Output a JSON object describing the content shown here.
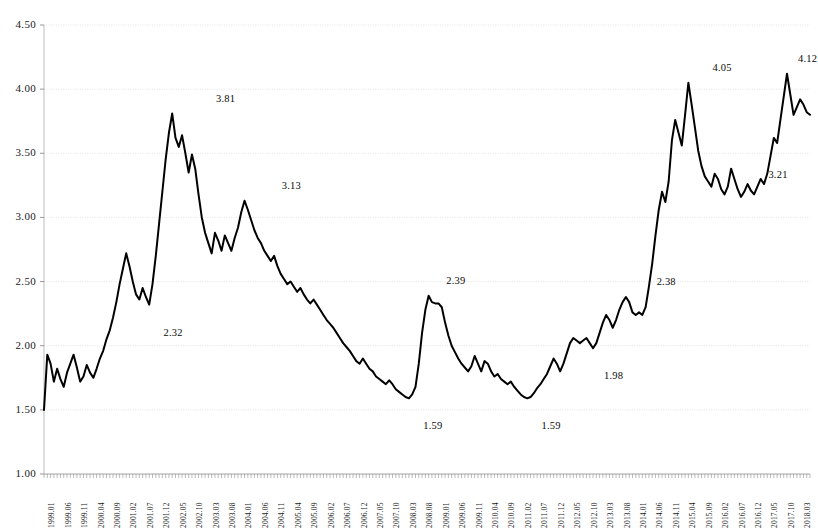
{
  "chart_data": {
    "type": "line",
    "title": "",
    "subtitle": "",
    "xlabel": "",
    "ylabel": "",
    "ylim": [
      1.0,
      4.5
    ],
    "ytick_step": 0.5,
    "ytick_labels": [
      "4.50",
      "4.00",
      "3.50",
      "3.00",
      "2.50",
      "2.00",
      "1.50",
      "1.00"
    ],
    "ytick_values": [
      4.5,
      4.0,
      3.5,
      3.0,
      2.5,
      2.0,
      1.5,
      1.0
    ],
    "grid": true,
    "legend": "none",
    "x_tick_labels": [
      "1999.01",
      "1999.06",
      "1999.11",
      "2000.04",
      "2000.09",
      "2001.02",
      "2001.07",
      "2001.12",
      "2002.05",
      "2002.10",
      "2003.03",
      "2003.08",
      "2004.01",
      "2004.06",
      "2004.11",
      "2005.04",
      "2005.09",
      "2006.02",
      "2006.07",
      "2006.12",
      "2007.05",
      "2007.10",
      "2008.03",
      "2008.08",
      "2009.01",
      "2009.06",
      "2009.11",
      "2010.04",
      "2010.09",
      "2011.02",
      "2011.07",
      "2011.12",
      "2012.05",
      "2012.10",
      "2013.03",
      "2013.08",
      "2014.01",
      "2014.06",
      "2014.11",
      "2015.04",
      "2015.09",
      "2016.02",
      "2016.07",
      "2016.12",
      "2017.05",
      "2017.10",
      "2018.03",
      "2018.08"
    ],
    "x_start": "1999.01",
    "x_end": "2018.08",
    "x_tick_interval_months": 5,
    "annotations": [
      {
        "label": "2.32",
        "x_index": 40,
        "value": 2.32,
        "position": "below"
      },
      {
        "label": "3.81",
        "x_index": 56,
        "value": 3.81,
        "position": "above"
      },
      {
        "label": "3.13",
        "x_index": 76,
        "value": 3.13,
        "position": "above"
      },
      {
        "label": "1.59",
        "x_index": 119,
        "value": 1.59,
        "position": "below"
      },
      {
        "label": "2.39",
        "x_index": 126,
        "value": 2.39,
        "position": "above"
      },
      {
        "label": "1.59",
        "x_index": 155,
        "value": 1.59,
        "position": "below"
      },
      {
        "label": "1.98",
        "x_index": 174,
        "value": 1.98,
        "position": "below"
      },
      {
        "label": "2.38",
        "x_index": 190,
        "value": 2.38,
        "position": "above"
      },
      {
        "label": "4.05",
        "x_index": 207,
        "value": 4.05,
        "position": "above"
      },
      {
        "label": "3.21",
        "x_index": 224,
        "value": 3.21,
        "position": "above"
      },
      {
        "label": "4.12",
        "x_index": 233,
        "value": 4.12,
        "position": "above"
      }
    ],
    "series": [
      {
        "name": "value",
        "color": "#000000",
        "values": [
          1.5,
          1.93,
          1.86,
          1.72,
          1.82,
          1.74,
          1.68,
          1.79,
          1.86,
          1.93,
          1.83,
          1.72,
          1.76,
          1.85,
          1.79,
          1.75,
          1.82,
          1.9,
          1.96,
          2.05,
          2.12,
          2.22,
          2.34,
          2.48,
          2.6,
          2.72,
          2.62,
          2.5,
          2.4,
          2.36,
          2.45,
          2.38,
          2.32,
          2.48,
          2.7,
          2.95,
          3.2,
          3.45,
          3.66,
          3.81,
          3.62,
          3.55,
          3.64,
          3.5,
          3.35,
          3.49,
          3.38,
          3.18,
          3.0,
          2.88,
          2.8,
          2.72,
          2.88,
          2.82,
          2.74,
          2.86,
          2.8,
          2.74,
          2.84,
          2.92,
          3.04,
          3.13,
          3.06,
          2.98,
          2.9,
          2.84,
          2.8,
          2.74,
          2.7,
          2.66,
          2.7,
          2.62,
          2.56,
          2.52,
          2.48,
          2.5,
          2.46,
          2.42,
          2.45,
          2.4,
          2.36,
          2.33,
          2.36,
          2.32,
          2.28,
          2.24,
          2.2,
          2.17,
          2.14,
          2.1,
          2.06,
          2.02,
          1.99,
          1.96,
          1.92,
          1.88,
          1.86,
          1.9,
          1.86,
          1.82,
          1.8,
          1.76,
          1.74,
          1.72,
          1.7,
          1.73,
          1.7,
          1.66,
          1.64,
          1.62,
          1.6,
          1.59,
          1.62,
          1.68,
          1.86,
          2.1,
          2.28,
          2.39,
          2.34,
          2.33,
          2.33,
          2.3,
          2.18,
          2.08,
          2.0,
          1.95,
          1.9,
          1.86,
          1.83,
          1.8,
          1.84,
          1.92,
          1.86,
          1.8,
          1.88,
          1.86,
          1.8,
          1.76,
          1.78,
          1.74,
          1.72,
          1.7,
          1.72,
          1.68,
          1.65,
          1.62,
          1.6,
          1.59,
          1.6,
          1.63,
          1.67,
          1.7,
          1.74,
          1.78,
          1.84,
          1.9,
          1.86,
          1.8,
          1.86,
          1.94,
          2.02,
          2.06,
          2.04,
          2.02,
          2.04,
          2.06,
          2.02,
          1.98,
          2.02,
          2.1,
          2.18,
          2.24,
          2.2,
          2.14,
          2.2,
          2.28,
          2.34,
          2.38,
          2.34,
          2.26,
          2.24,
          2.26,
          2.24,
          2.3,
          2.46,
          2.64,
          2.86,
          3.06,
          3.2,
          3.12,
          3.28,
          3.6,
          3.76,
          3.66,
          3.56,
          3.8,
          4.05,
          3.88,
          3.7,
          3.52,
          3.4,
          3.32,
          3.28,
          3.24,
          3.34,
          3.3,
          3.22,
          3.18,
          3.24,
          3.38,
          3.3,
          3.22,
          3.16,
          3.2,
          3.26,
          3.21,
          3.18,
          3.24,
          3.3,
          3.26,
          3.34,
          3.48,
          3.62,
          3.58,
          3.76,
          3.94,
          4.12,
          3.96,
          3.8,
          3.86,
          3.92,
          3.88,
          3.82,
          3.8
        ]
      }
    ]
  }
}
